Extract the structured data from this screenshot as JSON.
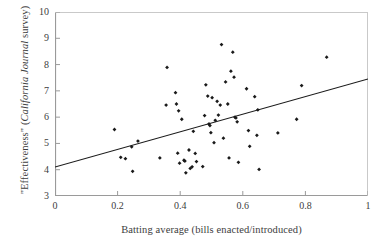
{
  "chart_data": {
    "type": "scatter",
    "title": "",
    "xlabel": "Batting average (bills enacted/introduced)",
    "ylabel_plain": "\"Effectiveness\" (California Journal survey)",
    "ylabel_prefix": "\"Effectiveness\" (",
    "ylabel_italic": "California Journal",
    "ylabel_suffix": " survey)",
    "xlim": [
      0,
      1
    ],
    "ylim": [
      3,
      10
    ],
    "xticks": [
      0,
      0.2,
      0.4,
      0.6,
      0.8,
      1
    ],
    "xtick_labels": [
      "0",
      "0.2",
      "0.4",
      "0.6",
      "0.8",
      "1"
    ],
    "yticks": [
      3,
      4,
      5,
      6,
      7,
      8,
      9,
      10
    ],
    "ytick_labels": [
      "3",
      "4",
      "5",
      "6",
      "7",
      "8",
      "9",
      "10"
    ],
    "grid": false,
    "legend": null,
    "marker": "diamond",
    "marker_color": "#1a1a1a",
    "axis_color": "#9a9a9a",
    "trendline": {
      "type": "line",
      "color": "#1a1a1a",
      "x": [
        0,
        1
      ],
      "y": [
        4.1,
        7.45
      ]
    },
    "points": [
      {
        "x": 0.19,
        "y": 5.53
      },
      {
        "x": 0.21,
        "y": 4.47
      },
      {
        "x": 0.225,
        "y": 4.42
      },
      {
        "x": 0.245,
        "y": 4.87
      },
      {
        "x": 0.248,
        "y": 3.94
      },
      {
        "x": 0.265,
        "y": 5.09
      },
      {
        "x": 0.335,
        "y": 4.45
      },
      {
        "x": 0.355,
        "y": 6.46
      },
      {
        "x": 0.358,
        "y": 7.89
      },
      {
        "x": 0.385,
        "y": 6.93
      },
      {
        "x": 0.388,
        "y": 6.5
      },
      {
        "x": 0.392,
        "y": 4.63
      },
      {
        "x": 0.395,
        "y": 6.24
      },
      {
        "x": 0.398,
        "y": 4.25
      },
      {
        "x": 0.405,
        "y": 5.92
      },
      {
        "x": 0.412,
        "y": 4.36
      },
      {
        "x": 0.415,
        "y": 4.33
      },
      {
        "x": 0.418,
        "y": 3.88
      },
      {
        "x": 0.428,
        "y": 4.75
      },
      {
        "x": 0.432,
        "y": 4.05
      },
      {
        "x": 0.438,
        "y": 4.11
      },
      {
        "x": 0.442,
        "y": 5.46
      },
      {
        "x": 0.448,
        "y": 4.62
      },
      {
        "x": 0.452,
        "y": 4.31
      },
      {
        "x": 0.472,
        "y": 4.12
      },
      {
        "x": 0.478,
        "y": 6.06
      },
      {
        "x": 0.482,
        "y": 7.23
      },
      {
        "x": 0.488,
        "y": 6.8
      },
      {
        "x": 0.492,
        "y": 5.74
      },
      {
        "x": 0.495,
        "y": 5.68
      },
      {
        "x": 0.498,
        "y": 5.41
      },
      {
        "x": 0.502,
        "y": 6.74
      },
      {
        "x": 0.508,
        "y": 5.03
      },
      {
        "x": 0.512,
        "y": 5.88
      },
      {
        "x": 0.518,
        "y": 6.6
      },
      {
        "x": 0.522,
        "y": 6.08
      },
      {
        "x": 0.528,
        "y": 6.46
      },
      {
        "x": 0.532,
        "y": 8.76
      },
      {
        "x": 0.538,
        "y": 5.2
      },
      {
        "x": 0.545,
        "y": 7.34
      },
      {
        "x": 0.552,
        "y": 6.5
      },
      {
        "x": 0.556,
        "y": 4.45
      },
      {
        "x": 0.562,
        "y": 7.75
      },
      {
        "x": 0.568,
        "y": 8.47
      },
      {
        "x": 0.572,
        "y": 7.52
      },
      {
        "x": 0.575,
        "y": 6.0
      },
      {
        "x": 0.578,
        "y": 5.97
      },
      {
        "x": 0.582,
        "y": 5.82
      },
      {
        "x": 0.586,
        "y": 4.28
      },
      {
        "x": 0.612,
        "y": 7.08
      },
      {
        "x": 0.618,
        "y": 5.49
      },
      {
        "x": 0.622,
        "y": 4.89
      },
      {
        "x": 0.638,
        "y": 6.78
      },
      {
        "x": 0.645,
        "y": 5.31
      },
      {
        "x": 0.648,
        "y": 6.28
      },
      {
        "x": 0.652,
        "y": 4.01
      },
      {
        "x": 0.712,
        "y": 5.4
      },
      {
        "x": 0.772,
        "y": 5.92
      },
      {
        "x": 0.788,
        "y": 7.2
      },
      {
        "x": 0.868,
        "y": 8.28
      }
    ]
  }
}
